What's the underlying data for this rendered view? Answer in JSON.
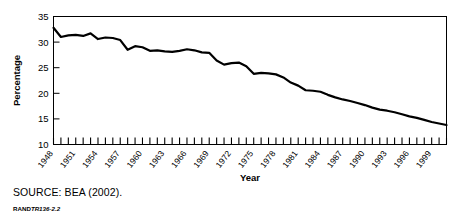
{
  "figure": {
    "source_note": "SOURCE: BEA (2002).",
    "rand_brand": "RAND",
    "rand_doc_id": "TR136-2.2"
  },
  "chart_data": {
    "type": "line",
    "title": "",
    "xlabel": "Year",
    "ylabel": "Percentage",
    "xlim": [
      1948,
      2001
    ],
    "ylim": [
      10,
      35
    ],
    "yticks": [
      10,
      15,
      20,
      25,
      30,
      35
    ],
    "ytick_labels": [
      "10",
      "15",
      "20",
      "25",
      "30",
      "35"
    ],
    "xtick_labels": [
      "1948",
      "1951",
      "1954",
      "1957",
      "1960",
      "1963",
      "1966",
      "1969",
      "1972",
      "1975",
      "1978",
      "1981",
      "1984",
      "1987",
      "1990",
      "1993",
      "1996",
      "1999"
    ],
    "xtick_values": [
      1948,
      1951,
      1954,
      1957,
      1960,
      1963,
      1966,
      1969,
      1972,
      1975,
      1978,
      1981,
      1984,
      1987,
      1990,
      1993,
      1996,
      1999
    ],
    "minor_xticks_every": 1,
    "grid": false,
    "legend": null,
    "line_color": "#000000",
    "line_width": 2.2,
    "x": [
      1948,
      1949,
      1950,
      1951,
      1952,
      1953,
      1954,
      1955,
      1956,
      1957,
      1958,
      1959,
      1960,
      1961,
      1962,
      1963,
      1964,
      1965,
      1966,
      1967,
      1968,
      1969,
      1970,
      1971,
      1972,
      1973,
      1974,
      1975,
      1976,
      1977,
      1978,
      1979,
      1980,
      1981,
      1982,
      1983,
      1984,
      1985,
      1986,
      1987,
      1988,
      1989,
      1990,
      1991,
      1992,
      1993,
      1994,
      1995,
      1996,
      1997,
      1998,
      1999,
      2000,
      2001
    ],
    "values": [
      32.8,
      31.0,
      31.3,
      31.4,
      31.2,
      31.7,
      30.6,
      30.9,
      30.8,
      30.4,
      28.5,
      29.2,
      29.0,
      28.3,
      28.4,
      28.2,
      28.1,
      28.3,
      28.6,
      28.4,
      28.0,
      27.9,
      26.4,
      25.6,
      25.9,
      26.0,
      25.3,
      23.8,
      24.0,
      23.9,
      23.7,
      23.1,
      22.1,
      21.5,
      20.6,
      20.5,
      20.3,
      19.7,
      19.2,
      18.8,
      18.5,
      18.1,
      17.7,
      17.2,
      16.8,
      16.6,
      16.3,
      15.9,
      15.5,
      15.2,
      14.8,
      14.4,
      14.1,
      13.8
    ]
  }
}
